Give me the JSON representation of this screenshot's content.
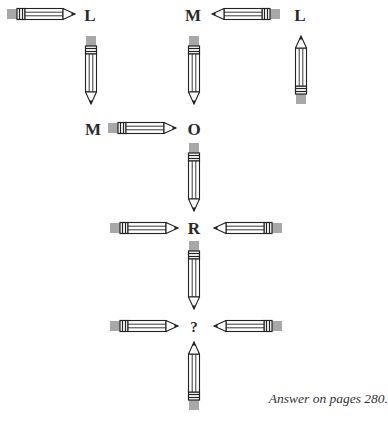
{
  "puzzle": {
    "letters": [
      {
        "id": "r1-l",
        "text": "L",
        "x": 90,
        "y": 15
      },
      {
        "id": "r1-m",
        "text": "M",
        "x": 193,
        "y": 15
      },
      {
        "id": "r1-l2",
        "text": "L",
        "x": 300,
        "y": 15
      },
      {
        "id": "r2-m",
        "text": "M",
        "x": 93,
        "y": 129
      },
      {
        "id": "r2-o",
        "text": "O",
        "x": 194,
        "y": 129
      },
      {
        "id": "r3-r",
        "text": "R",
        "x": 194,
        "y": 228
      },
      {
        "id": "r4-q",
        "text": "?",
        "x": 194,
        "y": 327
      }
    ],
    "pencils": [
      {
        "id": "p1",
        "x": 7,
        "y": 14,
        "dir": "right"
      },
      {
        "id": "p2",
        "x": 280,
        "y": 14,
        "dir": "left"
      },
      {
        "id": "p3",
        "x": 91,
        "y": 36,
        "dir": "down"
      },
      {
        "id": "p4",
        "x": 194,
        "y": 36,
        "dir": "down"
      },
      {
        "id": "p5",
        "x": 301,
        "y": 104,
        "dir": "up"
      },
      {
        "id": "p6",
        "x": 108,
        "y": 128,
        "dir": "right"
      },
      {
        "id": "p7",
        "x": 194,
        "y": 143,
        "dir": "down"
      },
      {
        "id": "p8",
        "x": 110,
        "y": 228,
        "dir": "right"
      },
      {
        "id": "p9",
        "x": 282,
        "y": 228,
        "dir": "left"
      },
      {
        "id": "p10",
        "x": 194,
        "y": 241,
        "dir": "down"
      },
      {
        "id": "p11",
        "x": 110,
        "y": 326,
        "dir": "right"
      },
      {
        "id": "p12",
        "x": 282,
        "y": 326,
        "dir": "left"
      },
      {
        "id": "p13",
        "x": 194,
        "y": 410,
        "dir": "up"
      }
    ],
    "caption": "Answer on pages 280."
  },
  "colors": {
    "eraser": "#a8a8a8",
    "outline": "#222222",
    "body": "#ffffff",
    "text": "#2a2a2a"
  }
}
